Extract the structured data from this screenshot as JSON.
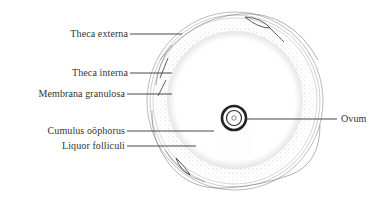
{
  "diagram": {
    "type": "anatomical-illustration",
    "labels_left": [
      {
        "text": "Theca externa",
        "y": 34
      },
      {
        "text": "Theca interna",
        "y": 73
      },
      {
        "text": "Membrana granulosa",
        "y": 94
      },
      {
        "text": "Cumulus oöphorus",
        "y": 131
      },
      {
        "text": "Liquor folliculi",
        "y": 146
      }
    ],
    "labels_right": [
      {
        "text": "Ovum",
        "y": 120
      }
    ],
    "colors": {
      "ink": "#333333",
      "background": "#ffffff",
      "stipple": "#9a9a9a"
    }
  }
}
